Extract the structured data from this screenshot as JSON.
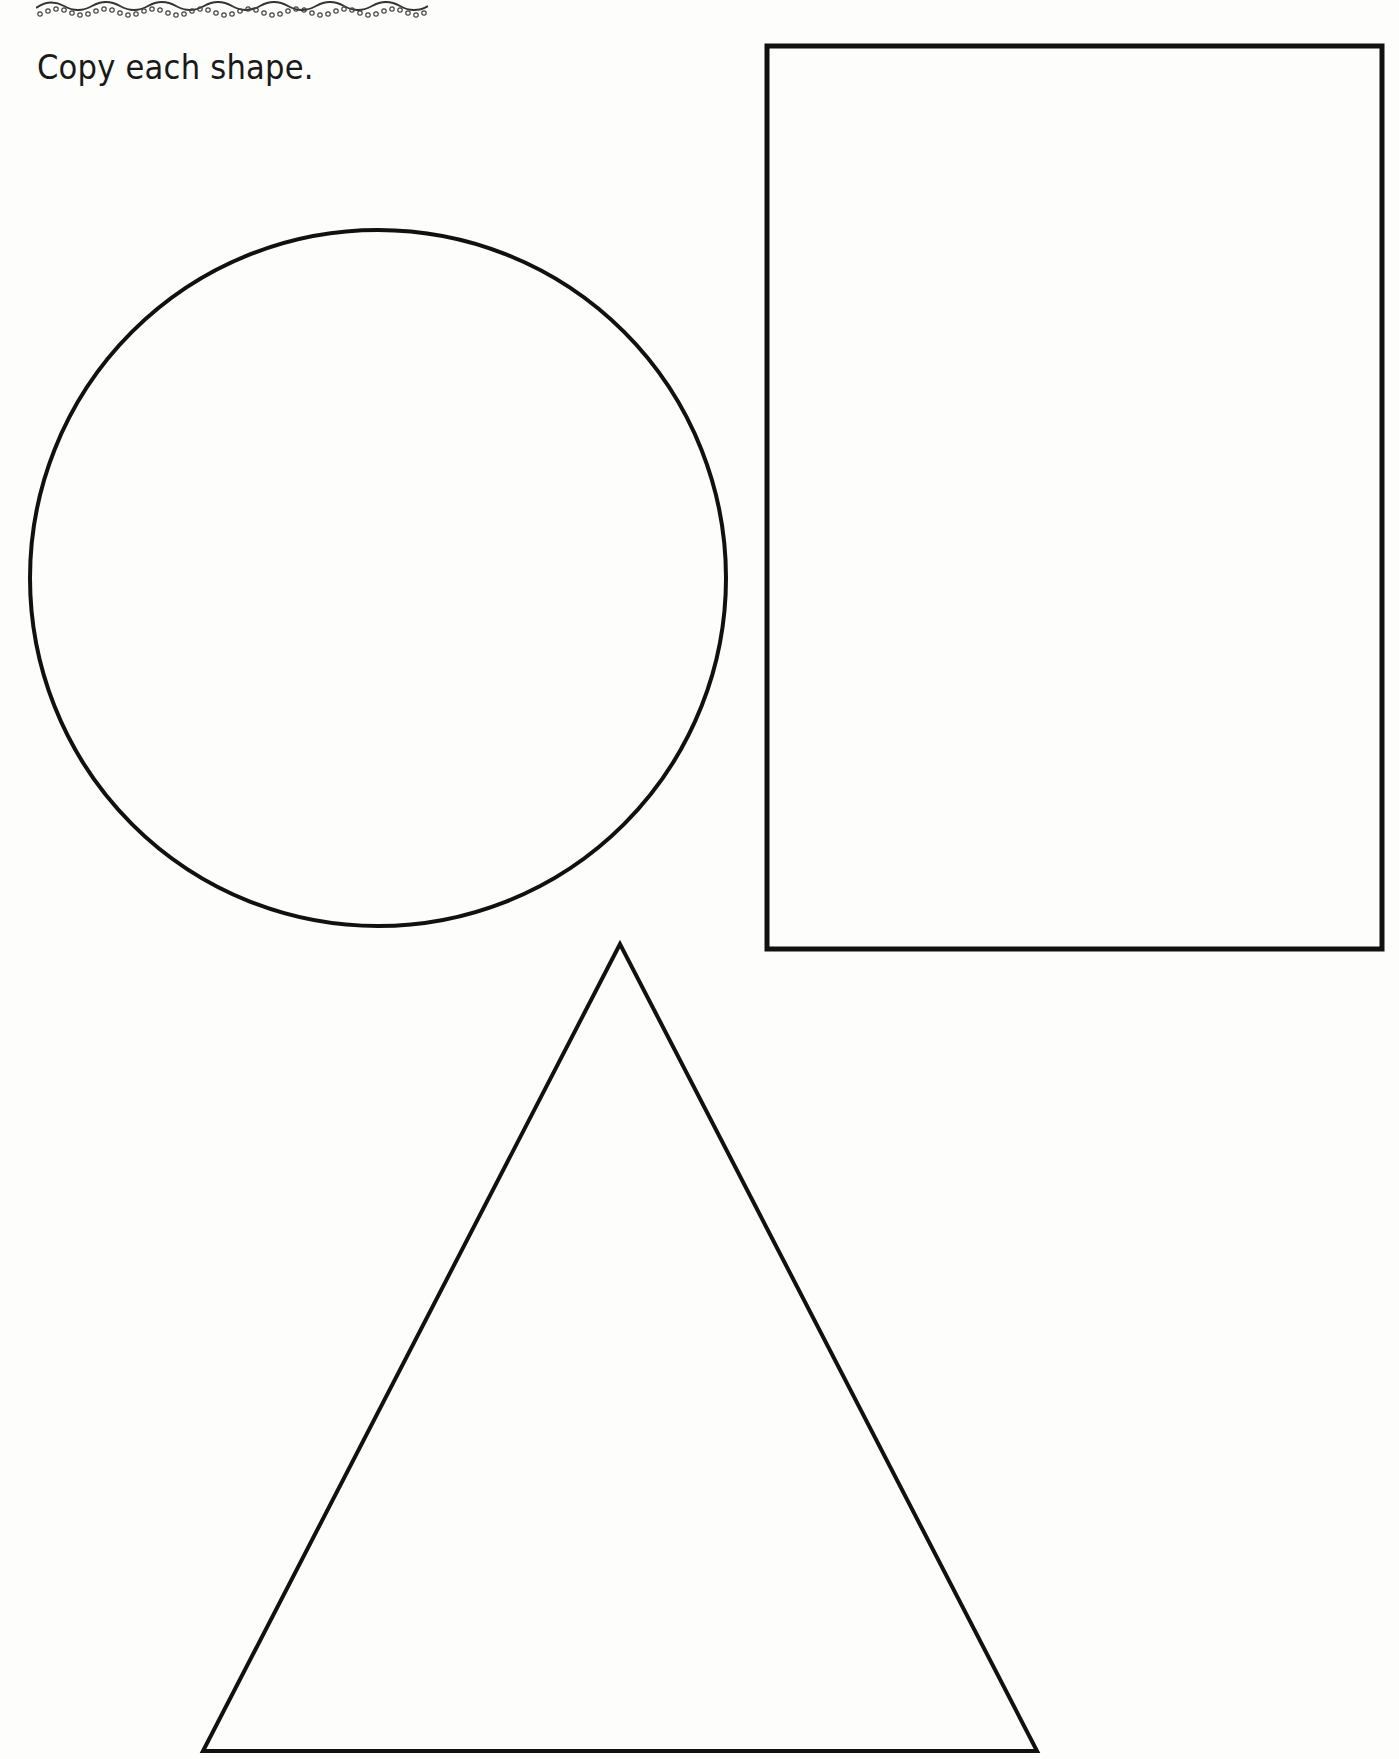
{
  "worksheet": {
    "instruction": "Copy each shape.",
    "border_decoration": "scalloped-wave-with-dots",
    "ink_color": "#111111"
  },
  "shapes": [
    {
      "name": "circle",
      "cx": 378,
      "cy": 578,
      "r": 348
    },
    {
      "name": "rectangle",
      "x": 767,
      "y": 46,
      "width": 615,
      "height": 903
    },
    {
      "name": "triangle",
      "points": "620,944 203,1751 1037,1751"
    }
  ]
}
